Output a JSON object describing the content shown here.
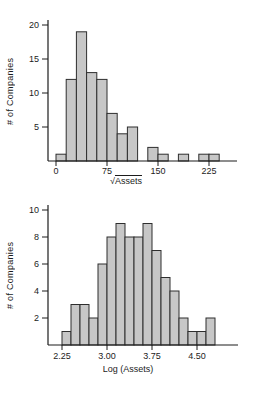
{
  "colors": {
    "background": "#ffffff",
    "bar_fill": "#c7c7c7",
    "bar_stroke": "#2e2e2e",
    "axis": "#1c1c1c",
    "text": "#1c1c1c"
  },
  "chart_data": [
    {
      "type": "bar",
      "subtype": "histogram",
      "title": "",
      "xlabel": "√Assets",
      "xlabel_radical": "√",
      "xlabel_arg": "Assets",
      "ylabel": "# of Companies",
      "bin_start": 0,
      "bin_width": 15,
      "bin_edges": [
        0,
        15,
        30,
        45,
        60,
        75,
        90,
        105,
        120,
        135,
        150,
        165,
        180,
        195,
        210,
        225,
        240
      ],
      "values": [
        1,
        12,
        19,
        13,
        12,
        7,
        4,
        5,
        0,
        2,
        1,
        0,
        1,
        0,
        1,
        1
      ],
      "x_tick_values": [
        0,
        75,
        150,
        225
      ],
      "x_tick_labels": [
        "0",
        "75",
        "150",
        "225"
      ],
      "y_tick_values": [
        5,
        10,
        15,
        20
      ],
      "y_tick_labels": [
        "5",
        "10",
        "15",
        "20"
      ],
      "xlim": [
        0,
        240
      ],
      "ylim": [
        0,
        20
      ],
      "grid": false,
      "legend_position": "none",
      "total_count": 79
    },
    {
      "type": "bar",
      "subtype": "histogram",
      "title": "",
      "xlabel": "Log (Assets)",
      "xlabel_radical": "",
      "xlabel_arg": "Log (Assets)",
      "ylabel": "# of Companies",
      "bin_start": 2.25,
      "bin_width": 0.15,
      "bin_edges": [
        2.25,
        2.4,
        2.55,
        2.7,
        2.85,
        3.0,
        3.15,
        3.3,
        3.45,
        3.6,
        3.75,
        3.9,
        4.05,
        4.2,
        4.35,
        4.5,
        4.65,
        4.8
      ],
      "values": [
        1,
        3,
        3,
        2,
        6,
        8,
        9,
        8,
        8,
        9,
        7,
        5,
        4,
        2,
        1,
        1,
        2
      ],
      "x_tick_values": [
        2.25,
        3.0,
        3.75,
        4.5
      ],
      "x_tick_labels": [
        "2.25",
        "3.00",
        "3.75",
        "4.50"
      ],
      "y_tick_values": [
        2,
        4,
        6,
        8,
        10
      ],
      "y_tick_labels": [
        "2",
        "4",
        "6",
        "8",
        "10"
      ],
      "xlim": [
        2.25,
        4.8
      ],
      "ylim": [
        0,
        10
      ],
      "grid": false,
      "legend_position": "none",
      "total_count": 79
    }
  ]
}
